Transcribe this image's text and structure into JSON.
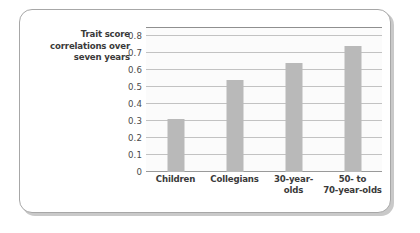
{
  "chart_data": {
    "type": "bar",
    "title": "",
    "subtitle": "",
    "xlabel": "",
    "ylabel": "Trait score correlations over seven years",
    "ylabel_lines": [
      "Trait score",
      "correlations over",
      "seven years"
    ],
    "categories": [
      "Children",
      "Collegians",
      "30-year-olds",
      "50- to 70-year-olds"
    ],
    "category_lines": [
      [
        "Children"
      ],
      [
        "Collegians"
      ],
      [
        "30-year-",
        "olds"
      ],
      [
        "50- to",
        "70-year-olds"
      ]
    ],
    "values": [
      0.31,
      0.54,
      0.64,
      0.74
    ],
    "ylim": [
      0,
      0.85
    ],
    "yticks": [
      0,
      0.1,
      0.2,
      0.3,
      0.4,
      0.5,
      0.6,
      0.7,
      0.8
    ],
    "ytick_labels": [
      "0",
      "0.1",
      "0.2",
      "0.3",
      "0.4",
      "0.5",
      "0.6",
      "0.7",
      "0.8"
    ],
    "grid": true,
    "grid_orientation": "horizontal",
    "legend": false,
    "legend_position": "none",
    "bar_color": "#b9b9b9",
    "grid_color": "#c2c2c2",
    "axis_color": "#8f8f8f",
    "text_color": "#3a3a3a",
    "plot_background": "#fbfbfb"
  },
  "card": {
    "border_color": "#a7a7a7",
    "shadow_color": "#c9c9c9",
    "background": "#ffffff"
  }
}
